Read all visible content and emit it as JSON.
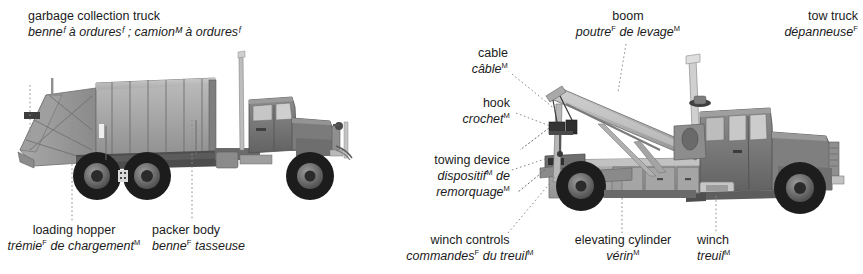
{
  "plate": {
    "title_en": "garbage collection truck",
    "background": "#ffffff"
  },
  "colors": {
    "text": "#1b1b1b",
    "leader": "#8c8c8c",
    "body_light": "#b9b9b9",
    "body_mid": "#9a9a9a",
    "body_dark": "#7a7a7a",
    "cab": "#6f6f6f",
    "glass": "#c9c9c9",
    "tire": "#1f1f1f",
    "hub": "#8a8a8a",
    "shadow": "#555555",
    "chrome": "#d4d4d4"
  },
  "garbage_truck": {
    "title": {
      "en": "garbage collection truck",
      "fr_parts": [
        {
          "t": "benne",
          "g": "F"
        },
        {
          "t": " à ordures",
          "g": "F"
        },
        {
          "t": " ; camion",
          "g": "M"
        },
        {
          "t": " à ordures",
          "g": "F"
        }
      ],
      "fr_plain": "benneᶠ à orduresᶠ ; camionᴹ à orduresᶠ"
    },
    "callouts": [
      {
        "id": "loading-hopper",
        "en": "loading hopper",
        "fr_parts": [
          {
            "t": "trémie",
            "g": "F"
          },
          {
            "t": " de chargement",
            "g": "M"
          }
        ]
      },
      {
        "id": "packer-body",
        "en": "packer body",
        "fr_parts": [
          {
            "t": "benne",
            "g": "F"
          },
          {
            "t": " tasseuse",
            "g": ""
          }
        ]
      }
    ]
  },
  "tow_truck": {
    "title": {
      "en": "tow truck",
      "fr_parts": [
        {
          "t": "dépanneuse",
          "g": "F"
        }
      ]
    },
    "callouts": [
      {
        "id": "cable",
        "en": "cable",
        "fr_parts": [
          {
            "t": "câble",
            "g": "M"
          }
        ]
      },
      {
        "id": "boom",
        "en": "boom",
        "fr_parts": [
          {
            "t": "poutre",
            "g": "F"
          },
          {
            "t": " de levage",
            "g": "M"
          }
        ]
      },
      {
        "id": "hook",
        "en": "hook",
        "fr_parts": [
          {
            "t": "crochet",
            "g": "M"
          }
        ]
      },
      {
        "id": "towing-device",
        "en": "towing device",
        "fr_parts": [
          {
            "t": "dispositif",
            "g": "M"
          },
          {
            "t": " de remorquage",
            "g": "M"
          }
        ]
      },
      {
        "id": "winch-controls",
        "en": "winch controls",
        "fr_parts": [
          {
            "t": "commandes",
            "g": "F"
          },
          {
            "t": " du treuil",
            "g": "M"
          }
        ]
      },
      {
        "id": "elevating-cylinder",
        "en": "elevating cylinder",
        "fr_parts": [
          {
            "t": "vérin",
            "g": "M"
          }
        ]
      },
      {
        "id": "winch",
        "en": "winch",
        "fr_parts": [
          {
            "t": "treuil",
            "g": "M"
          }
        ]
      }
    ]
  }
}
